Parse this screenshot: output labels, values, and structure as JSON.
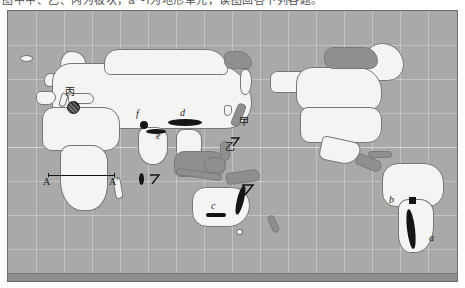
{
  "figure": {
    "caption_clipped": "图中甲、乙、丙为板块，a～f为地形单元，读图回答下列各题。",
    "type": "world-map",
    "projection_note": "world map with latitude/longitude graticule"
  },
  "colors": {
    "ocean": "#a9a9a9",
    "land": "#f4f4f2",
    "shelf": "#8f8f8f",
    "marker": "#151515",
    "frame": "#6d6d6d",
    "grid": "rgba(255,255,255,0.30)"
  },
  "map": {
    "frame": {
      "x": 7,
      "y": 10,
      "width": 451,
      "height": 272
    },
    "graticule": {
      "vertical_count": 16,
      "horizontal_count": 7,
      "equator_visible": true
    },
    "labels": [
      {
        "id": "label-a",
        "text": "a",
        "x": 428,
        "y": 234,
        "style": "italic-serif"
      },
      {
        "id": "label-b",
        "text": "b",
        "x": 388,
        "y": 199,
        "style": "italic-serif"
      },
      {
        "id": "label-c",
        "text": "c",
        "x": 207,
        "y": 199,
        "style": "italic-serif"
      },
      {
        "id": "label-d",
        "text": "d",
        "x": 178,
        "y": 102,
        "style": "italic-serif"
      },
      {
        "id": "label-e",
        "text": "e",
        "x": 156,
        "y": 121,
        "style": "italic-serif"
      },
      {
        "id": "label-f",
        "text": "f",
        "x": 136,
        "y": 104,
        "style": "italic-serif"
      },
      {
        "id": "label-jia",
        "text": "甲",
        "x": 238,
        "y": 116,
        "style": "cjk"
      },
      {
        "id": "label-yi",
        "text": "乙",
        "x": 224,
        "y": 141,
        "style": "cjk"
      },
      {
        "id": "label-bing",
        "text": "丙",
        "x": 65,
        "y": 88,
        "style": "cjk"
      }
    ],
    "cross_section": {
      "id": "cross-section-AA",
      "start_label": "A",
      "end_label": "A′",
      "start": {
        "x": 44,
        "y": 172
      },
      "end": {
        "x": 110,
        "y": 172
      },
      "across": "Africa"
    },
    "markers": [
      {
        "id": "marker-andes",
        "shape": "elongated-ellipse",
        "near": "a"
      },
      {
        "id": "marker-brazil-dot",
        "shape": "small-square",
        "near": "b"
      },
      {
        "id": "marker-australia-c",
        "shape": "horizontal-belt",
        "near": "c"
      },
      {
        "id": "marker-great-divide",
        "shape": "elongated-ellipse",
        "near": "east-australia"
      },
      {
        "id": "marker-mongolia-d",
        "shape": "horizontal-ellipse",
        "near": "d"
      },
      {
        "id": "marker-himalaya-e",
        "shape": "horizontal-ellipse",
        "near": "e"
      },
      {
        "id": "marker-pamir-f",
        "shape": "dot-ellipse",
        "near": "f"
      },
      {
        "id": "marker-indochina",
        "shape": "vertical-ellipse",
        "near": "southeast-asia"
      },
      {
        "id": "marker-alps-ring",
        "shape": "hatched-circle",
        "near": "丙"
      },
      {
        "id": "marker-arc-se-asia",
        "shape": "hook",
        "near": "southeast-asia"
      },
      {
        "id": "marker-arc-pacific",
        "shape": "hook",
        "near": "west-pacific"
      },
      {
        "id": "marker-arc-coral",
        "shape": "hook",
        "near": "coral-sea"
      }
    ]
  }
}
